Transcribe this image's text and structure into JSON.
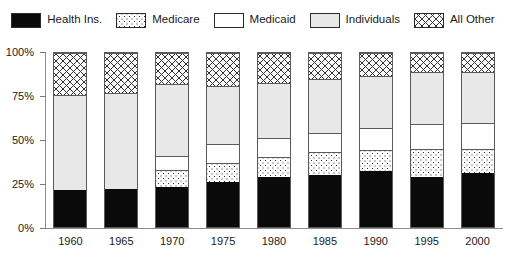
{
  "legend": {
    "items": [
      {
        "label": "Health Ins.",
        "pattern": "solid-black",
        "color": "#0a0a0a"
      },
      {
        "label": "Medicare",
        "pattern": "dots",
        "color": "#fdfdfd"
      },
      {
        "label": "Medicaid",
        "pattern": "white",
        "color": "#ffffff"
      },
      {
        "label": "Individuals",
        "pattern": "lightgray",
        "color": "#e8e8e8"
      },
      {
        "label": "All Other",
        "pattern": "crosshatch",
        "color": "#fbfbfb"
      }
    ]
  },
  "axes": {
    "y_ticks": [
      "0%",
      "25%",
      "50%",
      "75%",
      "100%"
    ],
    "x_ticks": [
      "1960",
      "1965",
      "1970",
      "1975",
      "1980",
      "1985",
      "1990",
      "1995",
      "2000"
    ]
  },
  "chart_data": {
    "type": "bar",
    "stacked": true,
    "title": "",
    "subtitle": "",
    "xlabel": "",
    "ylabel": "",
    "ylim": [
      0,
      100
    ],
    "grid": false,
    "legend_position": "top",
    "categories": [
      "1960",
      "1965",
      "1970",
      "1975",
      "1980",
      "1985",
      "1990",
      "1995",
      "2000"
    ],
    "series": [
      {
        "name": "Health Ins.",
        "pattern": "solid-black",
        "values": [
          21,
          22,
          23,
          26,
          29,
          30,
          32,
          29,
          31
        ]
      },
      {
        "name": "Medicare",
        "pattern": "dots",
        "values": [
          0,
          0,
          10,
          11,
          11,
          13,
          12,
          16,
          14
        ]
      },
      {
        "name": "Medicaid",
        "pattern": "white",
        "values": [
          0,
          0,
          8,
          11,
          11,
          11,
          13,
          14,
          15
        ]
      },
      {
        "name": "Individuals",
        "pattern": "lightgray",
        "values": [
          55,
          55,
          41,
          33,
          32,
          31,
          30,
          30,
          29
        ]
      },
      {
        "name": "All Other",
        "pattern": "crosshatch",
        "values": [
          24,
          23,
          18,
          19,
          17,
          15,
          13,
          11,
          11
        ]
      }
    ],
    "cumulative_tops": {
      "1960": [
        21,
        21,
        21,
        76,
        100
      ],
      "1965": [
        22,
        22,
        22,
        77,
        100
      ],
      "1970": [
        23,
        33,
        41,
        82,
        100
      ],
      "1975": [
        26,
        37,
        48,
        81,
        100
      ],
      "1980": [
        29,
        40,
        51,
        83,
        100
      ],
      "1985": [
        30,
        43,
        54,
        85,
        100
      ],
      "1990": [
        32,
        44,
        57,
        87,
        100
      ],
      "1995": [
        29,
        45,
        59,
        89,
        100
      ],
      "2000": [
        31,
        45,
        60,
        89,
        100
      ]
    }
  }
}
